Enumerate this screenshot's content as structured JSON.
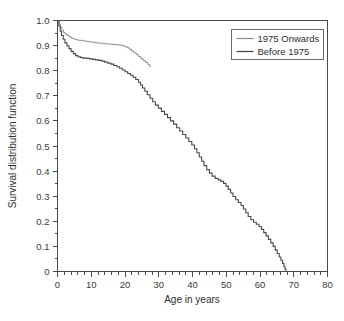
{
  "chart_data": {
    "type": "line",
    "title": "",
    "xlabel": "Age in years",
    "ylabel": "Survival distribution function",
    "xlim": [
      0,
      80
    ],
    "ylim": [
      0,
      1.0
    ],
    "grid": false,
    "xticks": [
      0,
      10,
      20,
      30,
      40,
      50,
      60,
      70,
      80
    ],
    "xticklabels": [
      "0",
      "10",
      "20",
      "30",
      "40",
      "50",
      "60",
      "70",
      "80"
    ],
    "xminor_step": 2,
    "yticks": [
      0,
      0.1,
      0.2,
      0.3,
      0.4,
      0.5,
      0.6,
      0.7,
      0.8,
      0.9,
      1.0
    ],
    "yticklabels": [
      "0",
      "0.1",
      "0.2",
      "0.3",
      "0.4",
      "0.5",
      "0.6",
      "0.7",
      "0.8",
      "0.9",
      "1.0"
    ],
    "yminor_step": 0.05,
    "legend_position": "upper right",
    "series": [
      {
        "name": "1975 Onwards",
        "color": "#8c8c8c",
        "linewidth": 1.0,
        "points": [
          [
            0.0,
            1.0
          ],
          [
            0.5,
            0.985
          ],
          [
            0.9,
            0.972
          ],
          [
            1.3,
            0.961
          ],
          [
            1.8,
            0.952
          ],
          [
            2.3,
            0.945
          ],
          [
            2.9,
            0.94
          ],
          [
            3.5,
            0.934
          ],
          [
            4.2,
            0.929
          ],
          [
            5.0,
            0.925
          ],
          [
            5.8,
            0.922
          ],
          [
            6.6,
            0.921
          ],
          [
            7.5,
            0.919
          ],
          [
            8.4,
            0.917
          ],
          [
            9.3,
            0.915
          ],
          [
            10.2,
            0.913
          ],
          [
            11.1,
            0.911
          ],
          [
            12.0,
            0.91
          ],
          [
            13.0,
            0.909
          ],
          [
            14.0,
            0.907
          ],
          [
            15.0,
            0.906
          ],
          [
            16.0,
            0.905
          ],
          [
            17.0,
            0.904
          ],
          [
            18.0,
            0.902
          ],
          [
            19.0,
            0.9
          ],
          [
            19.8,
            0.897
          ],
          [
            20.5,
            0.892
          ],
          [
            21.2,
            0.886
          ],
          [
            21.9,
            0.879
          ],
          [
            22.6,
            0.872
          ],
          [
            23.3,
            0.864
          ],
          [
            24.0,
            0.856
          ],
          [
            24.7,
            0.848
          ],
          [
            25.4,
            0.84
          ],
          [
            26.1,
            0.832
          ],
          [
            26.8,
            0.824
          ],
          [
            27.3,
            0.818
          ],
          [
            27.6,
            0.815
          ]
        ]
      },
      {
        "name": "Before 1975",
        "color": "#4a4a4a",
        "linewidth": 1.1,
        "points": [
          [
            0.0,
            1.0
          ],
          [
            0.4,
            0.978
          ],
          [
            0.8,
            0.957
          ],
          [
            1.2,
            0.94
          ],
          [
            1.7,
            0.925
          ],
          [
            2.2,
            0.911
          ],
          [
            2.8,
            0.899
          ],
          [
            3.4,
            0.888
          ],
          [
            4.0,
            0.877
          ],
          [
            4.7,
            0.868
          ],
          [
            5.4,
            0.86
          ],
          [
            6.1,
            0.855
          ],
          [
            6.9,
            0.852
          ],
          [
            7.7,
            0.85
          ],
          [
            8.6,
            0.849
          ],
          [
            9.5,
            0.847
          ],
          [
            10.4,
            0.845
          ],
          [
            11.3,
            0.843
          ],
          [
            12.2,
            0.841
          ],
          [
            13.1,
            0.838
          ],
          [
            14.0,
            0.834
          ],
          [
            14.9,
            0.83
          ],
          [
            15.8,
            0.826
          ],
          [
            16.7,
            0.821
          ],
          [
            17.6,
            0.816
          ],
          [
            18.4,
            0.81
          ],
          [
            19.2,
            0.803
          ],
          [
            20.0,
            0.796
          ],
          [
            20.8,
            0.789
          ],
          [
            21.6,
            0.782
          ],
          [
            22.4,
            0.774
          ],
          [
            23.2,
            0.765
          ],
          [
            24.0,
            0.754
          ],
          [
            24.6,
            0.743
          ],
          [
            25.2,
            0.731
          ],
          [
            25.9,
            0.718
          ],
          [
            26.6,
            0.704
          ],
          [
            27.4,
            0.69
          ],
          [
            28.2,
            0.676
          ],
          [
            29.0,
            0.663
          ],
          [
            29.9,
            0.651
          ],
          [
            30.8,
            0.638
          ],
          [
            31.7,
            0.626
          ],
          [
            32.6,
            0.613
          ],
          [
            33.5,
            0.6
          ],
          [
            34.4,
            0.587
          ],
          [
            35.3,
            0.573
          ],
          [
            36.2,
            0.56
          ],
          [
            37.1,
            0.546
          ],
          [
            38.0,
            0.532
          ],
          [
            38.9,
            0.518
          ],
          [
            39.8,
            0.504
          ],
          [
            40.6,
            0.489
          ],
          [
            41.3,
            0.473
          ],
          [
            42.0,
            0.456
          ],
          [
            42.7,
            0.439
          ],
          [
            43.4,
            0.422
          ],
          [
            44.2,
            0.406
          ],
          [
            45.0,
            0.392
          ],
          [
            45.8,
            0.38
          ],
          [
            46.7,
            0.371
          ],
          [
            47.6,
            0.365
          ],
          [
            48.4,
            0.359
          ],
          [
            49.2,
            0.351
          ],
          [
            49.9,
            0.34
          ],
          [
            50.6,
            0.327
          ],
          [
            51.3,
            0.313
          ],
          [
            52.0,
            0.299
          ],
          [
            52.8,
            0.286
          ],
          [
            53.6,
            0.275
          ],
          [
            54.4,
            0.263
          ],
          [
            55.1,
            0.249
          ],
          [
            55.8,
            0.234
          ],
          [
            56.5,
            0.219
          ],
          [
            57.3,
            0.206
          ],
          [
            58.1,
            0.196
          ],
          [
            58.9,
            0.188
          ],
          [
            59.7,
            0.179
          ],
          [
            60.4,
            0.168
          ],
          [
            61.1,
            0.155
          ],
          [
            61.8,
            0.142
          ],
          [
            62.5,
            0.128
          ],
          [
            63.2,
            0.114
          ],
          [
            63.9,
            0.1
          ],
          [
            64.5,
            0.086
          ],
          [
            65.1,
            0.072
          ],
          [
            65.7,
            0.058
          ],
          [
            66.2,
            0.045
          ],
          [
            66.7,
            0.032
          ],
          [
            67.1,
            0.02
          ],
          [
            67.4,
            0.01
          ],
          [
            67.7,
            0.0
          ]
        ]
      }
    ]
  },
  "legend": {
    "entries": [
      {
        "label": "1975 Onwards"
      },
      {
        "label": "Before 1975"
      }
    ]
  }
}
